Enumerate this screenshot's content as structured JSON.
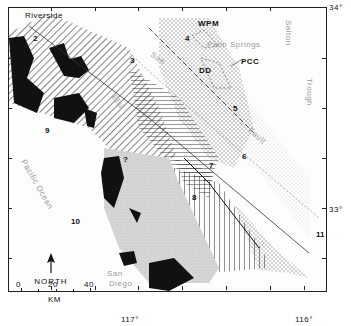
{
  "map": {
    "place_labels": {
      "riverside": "Riverside",
      "palm_springs": "Palm Springs",
      "san_diego_line1": "San",
      "san_diego_line2": "Diego",
      "pacific_ocean": "Pacific Ocean",
      "salton_trough_1": "Salton",
      "salton_trough_2": "Trough",
      "san_jacinto": "San",
      "elsinore": "Elsi",
      "fault": "Fault"
    },
    "unit_labels": {
      "wpm": "WPM",
      "pcc": "PCC",
      "dd": "DD"
    },
    "sites": [
      "1",
      "2",
      "3",
      "4",
      "5",
      "6",
      "7",
      "8",
      "9",
      "10",
      "11"
    ],
    "question_marks": [
      "?",
      "?"
    ],
    "coordinates": {
      "lat_34": "34°",
      "lat_33": "33°",
      "lon_117": "117°",
      "lon_116": "116°"
    },
    "north_arrow": {
      "label": "NORTH"
    },
    "scale_bar": {
      "ticks": [
        "0",
        "20",
        "40"
      ],
      "unit": "KM"
    }
  }
}
